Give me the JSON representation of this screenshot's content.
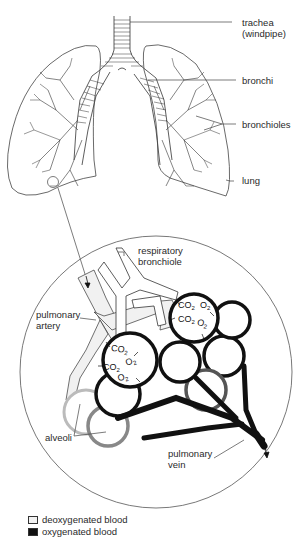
{
  "labels": {
    "trachea": "trachea",
    "trachea_alt": "(windpipe)",
    "bronchi": "bronchi",
    "bronchioles": "bronchioles",
    "lung": "lung",
    "respiratory_bronchiole_1": "respiratory",
    "respiratory_bronchiole_2": "bronchiole",
    "pulmonary_artery_1": "pulmonary",
    "pulmonary_artery_2": "artery",
    "alveoli": "alveoli",
    "pulmonary_vein_1": "pulmonary",
    "pulmonary_vein_2": "vein"
  },
  "gas_exchange": {
    "co2": "CO",
    "o2": "O",
    "sub": "2"
  },
  "legend": {
    "items": [
      {
        "label": "deoxygenated blood",
        "color": "#f2f2f2"
      },
      {
        "label": "oxygenated blood",
        "color": "#111111"
      }
    ]
  }
}
